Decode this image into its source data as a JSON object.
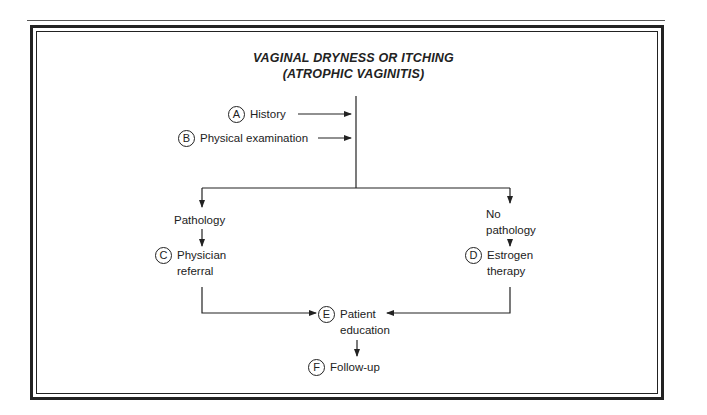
{
  "diagram": {
    "title_line1": "VAGINAL DRYNESS OR ITCHING",
    "title_line2": "(ATROPHIC VAGINITIS)",
    "nodes": {
      "history": {
        "badge": "A",
        "label": "History"
      },
      "physical_exam": {
        "badge": "B",
        "label": "Physical examination"
      },
      "pathology": {
        "label": "Pathology"
      },
      "physician_referral": {
        "badge": "C",
        "line1": "Physician",
        "line2": "referral"
      },
      "no_pathology": {
        "line1": "No",
        "line2": "pathology"
      },
      "estrogen_therapy": {
        "badge": "D",
        "line1": "Estrogen",
        "line2": "therapy"
      },
      "patient_education": {
        "badge": "E",
        "line1": "Patient",
        "line2": "education"
      },
      "follow_up": {
        "badge": "F",
        "label": "Follow-up"
      }
    },
    "edges": [
      {
        "from": "history",
        "to": "trunk"
      },
      {
        "from": "physical_exam",
        "to": "trunk"
      },
      {
        "from": "trunk",
        "to": "pathology"
      },
      {
        "from": "trunk",
        "to": "no_pathology"
      },
      {
        "from": "pathology",
        "to": "physician_referral"
      },
      {
        "from": "no_pathology",
        "to": "estrogen_therapy"
      },
      {
        "from": "physician_referral",
        "to": "patient_education"
      },
      {
        "from": "estrogen_therapy",
        "to": "patient_education"
      },
      {
        "from": "patient_education",
        "to": "follow_up"
      }
    ]
  }
}
